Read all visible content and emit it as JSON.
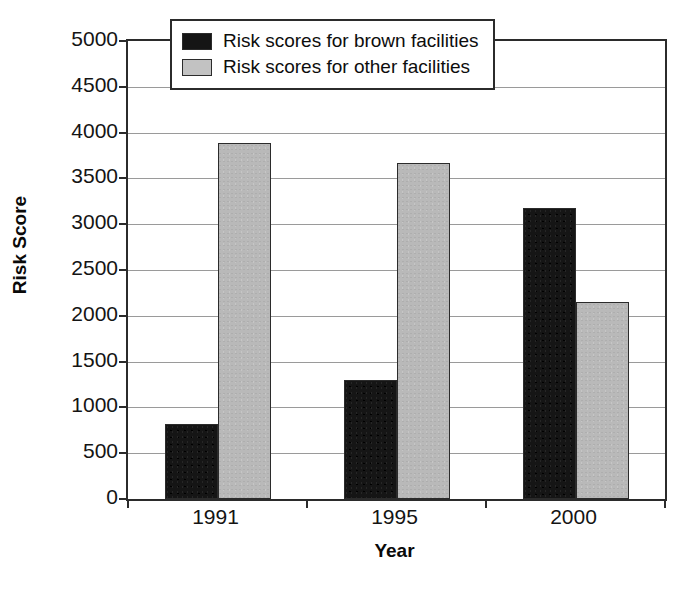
{
  "chart_data": {
    "type": "bar",
    "title": "",
    "xlabel": "Year",
    "ylabel": "Risk Score",
    "categories": [
      "1991",
      "1995",
      "2000"
    ],
    "series": [
      {
        "name": "Risk scores for brown facilities",
        "color": "#151515",
        "values": [
          820,
          1300,
          3180
        ]
      },
      {
        "name": "Risk scores for other facilities",
        "color": "#b9b9b9",
        "values": [
          3890,
          3670,
          2150
        ]
      }
    ],
    "ylim": [
      0,
      5000
    ],
    "ytick_step": 500,
    "ytick_labels": [
      "5000",
      "4500",
      "4000",
      "3500",
      "3000",
      "2500",
      "2000",
      "1500",
      "1000",
      "500",
      "0"
    ],
    "ytick_values": [
      5000,
      4500,
      4000,
      3500,
      3000,
      2500,
      2000,
      1500,
      1000,
      500,
      0
    ],
    "grid": true,
    "legend_position": "top-right-inside"
  },
  "legend": {
    "items": [
      {
        "label": "Risk scores for brown facilities",
        "swatch": "black-swatch-icon"
      },
      {
        "label": "Risk scores for other facilities",
        "swatch": "gray-swatch-icon"
      }
    ]
  }
}
